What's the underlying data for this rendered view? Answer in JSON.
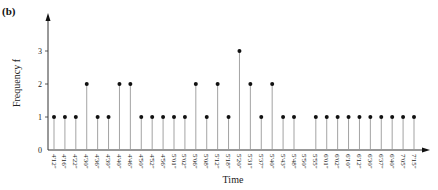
{
  "figure": {
    "panel_label": "(b)"
  },
  "chart_data": {
    "type": "stem",
    "title": "",
    "panel": "(b)",
    "xlabel": "Time",
    "ylabel": "Frequency f",
    "ylim": [
      0,
      3.5
    ],
    "yticks": [
      0,
      1,
      2,
      3
    ],
    "grid": false,
    "legend": null,
    "categories": [
      "4'12\"",
      "4'16\"",
      "4'22\"",
      "4'30\"",
      "4'36\"",
      "4'39\"",
      "4'40\"",
      "4'46\"",
      "4'50\"",
      "4'52\"",
      "4'56\"",
      "5'01\"",
      "5'02\"",
      "5'06\"",
      "5'08\"",
      "5'12\"",
      "5'18\"",
      "5'20\"",
      "5'31\"",
      "5'37\"",
      "5'40\"",
      "5'43\"",
      "5'48\"",
      "5'50\"",
      "5'55\"",
      "6'01\"",
      "6'02\"",
      "6'10\"",
      "6'12\"",
      "6'30\"",
      "6'37\"",
      "6'40\"",
      "7'05\"",
      "7'15\""
    ],
    "values": [
      1,
      1,
      1,
      2,
      1,
      1,
      2,
      2,
      1,
      1,
      1,
      1,
      1,
      2,
      1,
      2,
      1,
      3,
      2,
      1,
      2,
      1,
      1,
      0,
      1,
      1,
      1,
      1,
      1,
      1,
      1,
      1,
      1,
      1
    ]
  },
  "style": {
    "axis_color": "#333333",
    "stem_color": "#999999",
    "marker_color": "#111111"
  }
}
